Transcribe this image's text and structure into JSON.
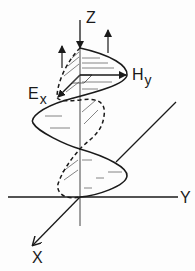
{
  "diagram": {
    "type": "electromagnetic-wave",
    "axes": {
      "z_label": "Z",
      "y_label": "Y",
      "x_label": "X"
    },
    "fields": {
      "electric": {
        "symbol": "E",
        "subscript": "x",
        "style": "dashed"
      },
      "magnetic": {
        "symbol": "H",
        "subscript": "y",
        "style": "solid"
      }
    },
    "colors": {
      "ink": "#1a1a1a",
      "background": "#fdfdfd",
      "hatch": "#555555"
    }
  }
}
